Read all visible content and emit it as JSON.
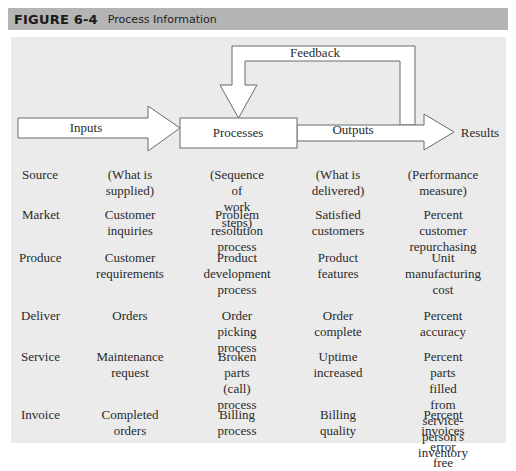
{
  "figure": {
    "number": "FIGURE 6-4",
    "title": "Process Information"
  },
  "diagram": {
    "nodes": {
      "inputs": "Inputs",
      "processes": "Processes",
      "outputs": "Outputs",
      "results": "Results",
      "feedback": "Feedback"
    },
    "colors": {
      "header_band": "#b4b4b4",
      "panel": "#ebebeb",
      "shape_fill": "#ffffff",
      "shape_stroke": "#6a6a6a"
    }
  },
  "table": {
    "columns": [
      "Stage",
      "Inputs",
      "Processes",
      "Outputs",
      "Results"
    ],
    "rows": [
      {
        "stage": "Source",
        "input": "(What is\nsupplied)",
        "process": "(Sequence of\nwork steps)",
        "output": "(What is\ndelivered)",
        "result": "(Performance\nmeasure)"
      },
      {
        "stage": "Market",
        "input": "Customer\ninquiries",
        "process": "Problem resolution\nprocess",
        "output": "Satisfied\ncustomers",
        "result": "Percent customer\nrepurchasing"
      },
      {
        "stage": "Produce",
        "input": "Customer\nrequirements",
        "process": "Product\ndevelopment\nprocess",
        "output": "Product\nfeatures",
        "result": "Unit\nmanufacturing\ncost"
      },
      {
        "stage": "Deliver",
        "input": "Orders",
        "process": "Order picking\nprocess",
        "output": "Order\ncomplete",
        "result": "Percent\naccuracy"
      },
      {
        "stage": "Service",
        "input": "Maintenance\nrequest",
        "process": "Broken\nparts (call)\nprocess",
        "output": "Uptime\nincreased",
        "result": "Percent parts filled\nfrom service-\nperson's inventory"
      },
      {
        "stage": "Invoice",
        "input": "Completed\norders",
        "process": "Billing\nprocess",
        "output": "Billing\nquality",
        "result": "Percent invoices\nerror free"
      }
    ]
  }
}
